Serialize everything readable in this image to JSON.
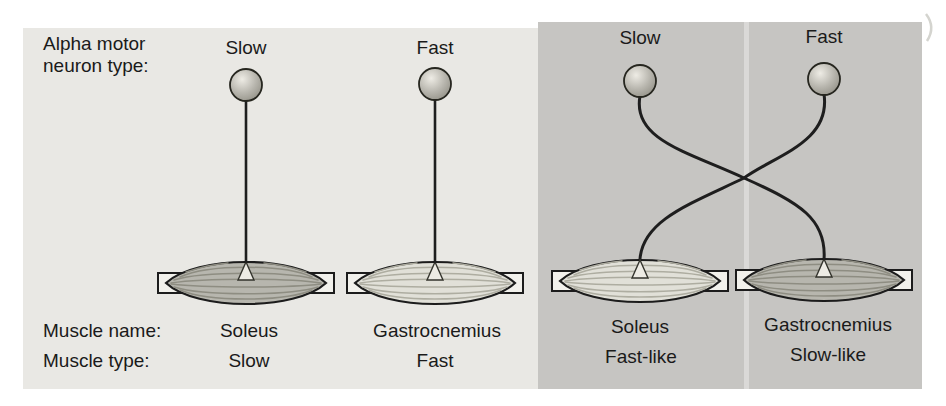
{
  "figure": {
    "left_panel": {
      "neuron_row_label_line1": "Alpha motor",
      "neuron_row_label_line2": "neuron type:",
      "muscle_name_row_label": "Muscle name:",
      "muscle_type_row_label": "Muscle type:",
      "columns": [
        {
          "neuron_type": "Slow",
          "muscle_name": "Soleus",
          "muscle_type": "Slow"
        },
        {
          "neuron_type": "Fast",
          "muscle_name": "Gastrocnemius",
          "muscle_type": "Fast"
        }
      ]
    },
    "right_panel": {
      "columns": [
        {
          "neuron_type": "Slow",
          "muscle_name": "Soleus",
          "muscle_type": "Fast-like"
        },
        {
          "neuron_type": "Fast",
          "muscle_name": "Gastrocnemius",
          "muscle_type": "Slow-like"
        }
      ]
    }
  },
  "colors": {
    "page_bg": "#ffffff",
    "left_panel_bg": "#e9e8e4",
    "right_panel_bg": "#c6c5c2",
    "text": "#1a1a1a",
    "outline": "#1c1c1c",
    "axon": "#1e1e1e",
    "tendon_fill": "#f2f1ec",
    "muscle_slow_fill": "#b7b6ae",
    "muscle_fast_fill": "#e1e0d8",
    "striation_slow": "#8e8d82",
    "striation_fast": "#aeada1",
    "terminal_fill": "#edebe4",
    "soma_highlight": "#eeece5",
    "soma_mid": "#b7b5ad",
    "soma_dark": "#8e8c82",
    "crease_highlight": "rgba(255,255,255,0.35)",
    "page_mark": "#d4d4cf"
  }
}
